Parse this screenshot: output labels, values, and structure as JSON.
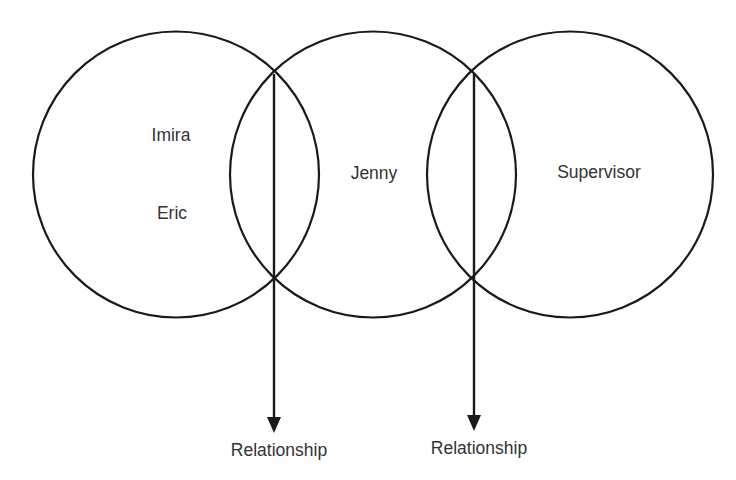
{
  "diagram": {
    "type": "overlapping-circles",
    "circles": [
      {
        "id": "left",
        "labels": [
          "Imira",
          "Eric"
        ]
      },
      {
        "id": "middle",
        "labels": [
          "Jenny"
        ]
      },
      {
        "id": "right",
        "labels": [
          "Supervisor"
        ]
      }
    ],
    "arrows": [
      {
        "from": "intersection of left and middle circles",
        "label": "Relationship"
      },
      {
        "from": "intersection of middle and right circles",
        "label": "Relationship"
      }
    ],
    "colors": {
      "stroke": "#1a1a1a",
      "text": "#333333",
      "background": "#ffffff"
    }
  }
}
